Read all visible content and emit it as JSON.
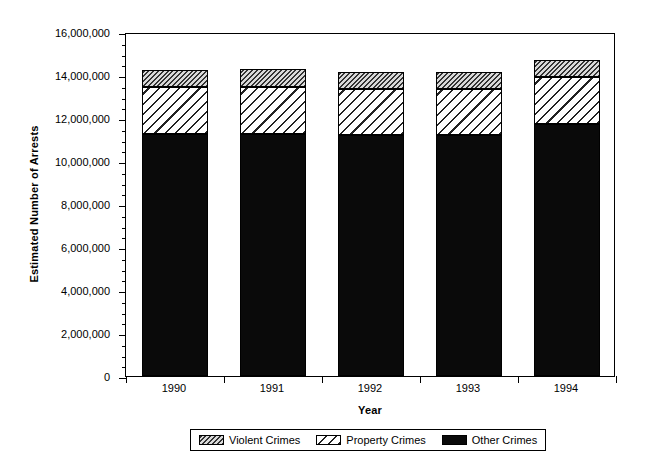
{
  "chart_data": {
    "type": "bar",
    "subtype": "stacked-bar",
    "title": "",
    "xlabel": "Year",
    "ylabel": "Estimated Number of Arrests",
    "categories": [
      "1990",
      "1991",
      "1992",
      "1993",
      "1994"
    ],
    "series": [
      {
        "name": "Other Crimes",
        "values": [
          11260000,
          11260000,
          11210000,
          11210000,
          11720000
        ]
      },
      {
        "name": "Property Crimes",
        "values": [
          2180000,
          2180000,
          2140000,
          2140000,
          2190000
        ]
      },
      {
        "name": "Violent Crimes",
        "values": [
          790000,
          860000,
          790000,
          790000,
          790000
        ]
      }
    ],
    "totals": [
      14230000,
      14300000,
      14140000,
      14140000,
      14700000
    ],
    "stack_order": [
      "Other Crimes",
      "Property Crimes",
      "Violent Crimes"
    ],
    "ylim": [
      0,
      16000000
    ],
    "ytick_labels": [
      "0",
      "2,000,000",
      "4,000,000",
      "6,000,000",
      "8,000,000",
      "10,000,000",
      "12,000,000",
      "14,000,000",
      "16,000,000"
    ],
    "ytick_values": [
      0,
      2000000,
      4000000,
      6000000,
      8000000,
      10000000,
      12000000,
      14000000,
      16000000
    ],
    "ytick_minor_interval": 500000,
    "grid": false,
    "legend_position": "bottom-outside",
    "legend": [
      {
        "label": "Violent Crimes",
        "pattern": "dense-diagonal-hatch",
        "color": "#333333"
      },
      {
        "label": "Property Crimes",
        "pattern": "sparse-diagonal-hatch",
        "color": "#222222"
      },
      {
        "label": "Other Crimes",
        "pattern": "solid",
        "color": "#0a0a0a"
      }
    ]
  }
}
